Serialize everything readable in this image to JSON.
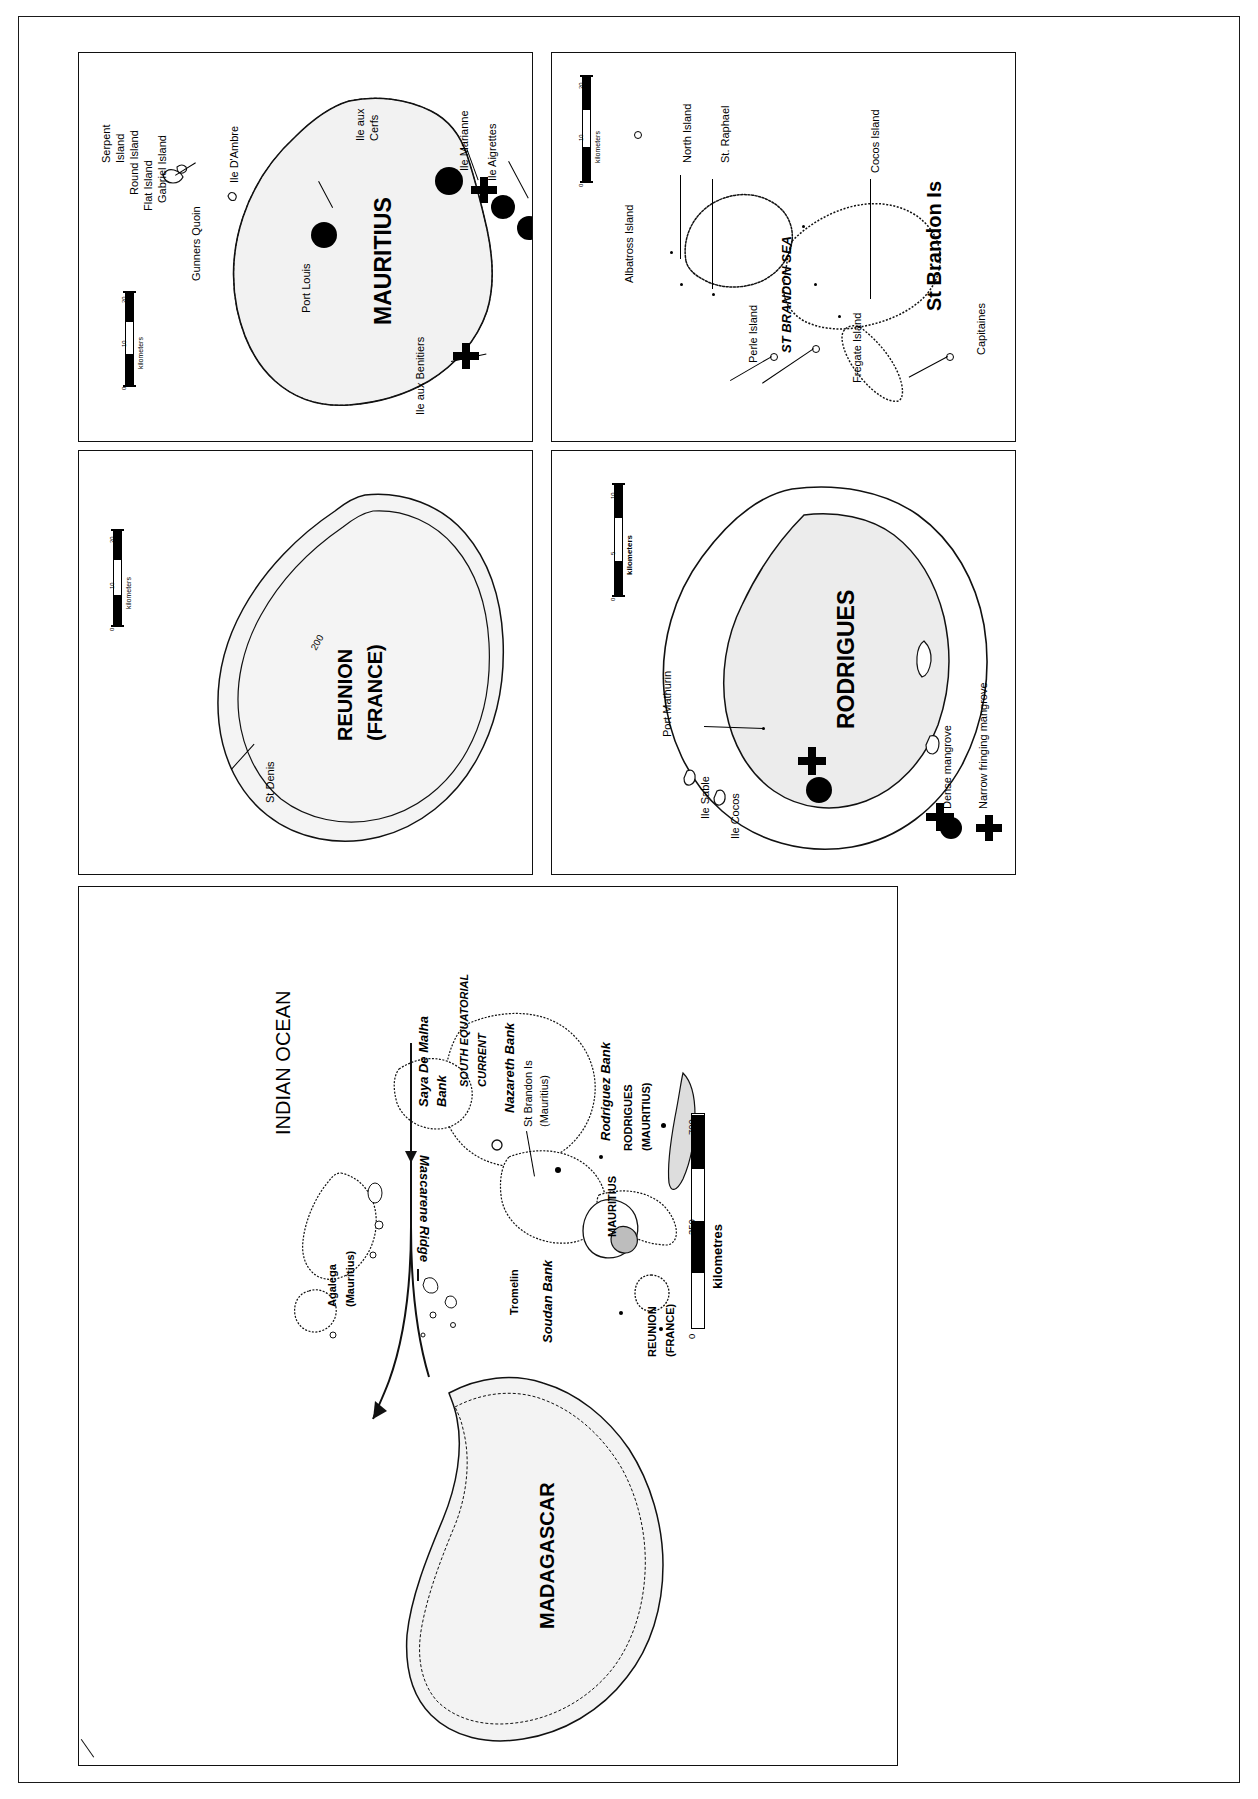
{
  "figure": {
    "orientation": "rotated-90-ccw"
  },
  "legend": {
    "title": "",
    "items": [
      {
        "symbol": "filled-circle",
        "label": "Dense mangrove"
      },
      {
        "symbol": "cross",
        "label": "Narrow fringing mangrove"
      }
    ]
  },
  "panels": {
    "mauritius": {
      "title": "MAURITIUS",
      "scale": {
        "units": "kilometers",
        "ticks": [
          "0",
          "10",
          "20"
        ]
      },
      "labels": [
        "Serpent Island",
        "Round Island",
        "Flat Island",
        "Gabriel Island",
        "Gunners Quoin",
        "Ile D'Ambre",
        "Port Louis",
        "Ile aux Cerfs",
        "Ile Marianne",
        "Ile Aigrettes",
        "Ile aux Benitiers"
      ],
      "label_serpent_line1": "Serpent",
      "label_serpent_line2": "Island",
      "label_round": "Round Island",
      "label_flat": "Flat Island",
      "label_gabriel": "Gabriel Island",
      "label_gunners": "Gunners Quoin",
      "label_dambre": "Ile D'Ambre",
      "label_portlouis": "Port Louis",
      "label_cerfs_l1": "Ile aux",
      "label_cerfs_l2": "Cerfs",
      "label_marianne": "Ile Marianne",
      "label_aigrettes": "Ile Aigrettes",
      "label_benitiers": "Ile aux Benitiers"
    },
    "st_brandon": {
      "title": "St Brandon Is",
      "sea_label": "ST BRANDON SEA",
      "scale": {
        "units": "kilometers",
        "ticks": [
          "0",
          "10",
          "20"
        ]
      },
      "label_albatross": "Albatross Island",
      "label_north": "North Island",
      "label_straphael": "St. Raphael",
      "label_cocos": "Cocos Island",
      "label_perle": "Perle Island",
      "label_fregate": "Fregate Island",
      "label_capitaines": "Capitaines"
    },
    "reunion": {
      "title_line1": "REUNION",
      "title_line2": "(FRANCE)",
      "label_stdenis": "St Denis",
      "contour_label": "200",
      "scale": {
        "units": "kilometers",
        "ticks": [
          "0",
          "10",
          "20"
        ]
      }
    },
    "rodrigues": {
      "title": "RODRIGUES",
      "label_port_mathurin": "Port Mathurin",
      "label_ile_sable": "Ile Sable",
      "label_ile_cocos": "Ile Cocos",
      "scale": {
        "units": "kilometers",
        "ticks": [
          "0",
          "5",
          "10"
        ]
      }
    },
    "overview": {
      "ocean_label": "INDIAN OCEAN",
      "ridge_label": "Mascarene Ridge",
      "current_line1": "SOUTH EQUATORIAL",
      "current_line2": "CURRENT",
      "label_saya_l1": "Saya De Malha",
      "label_saya_l2": "Bank",
      "label_nazareth": "Nazareth Bank",
      "label_stbrandon_l1": "St Brandon Is",
      "label_stbrandon_l2": "(Mauritius)",
      "label_rodriguez_bank": "Rodriguez Bank",
      "label_rodrigues_l1": "RODRIGUES",
      "label_rodrigues_l2": "(MAURITIUS)",
      "label_agalega_l1": "Agalega",
      "label_agalega_l2": "(Mauritius)",
      "label_tromelin": "Tromelin",
      "label_soudan": "Soudan Bank",
      "label_mauritius": "MAURITIUS",
      "label_reunion_l1": "REUNION",
      "label_reunion_l2": "(FRANCE)",
      "label_madagascar": "MADAGASCAR",
      "scale": {
        "units": "kilometres",
        "ticks": [
          "0",
          "350",
          "700"
        ]
      }
    }
  }
}
